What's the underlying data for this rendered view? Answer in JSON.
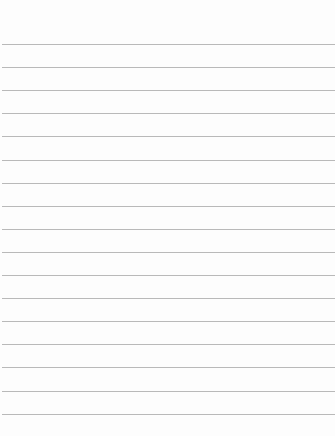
{
  "page": {
    "type": "lined-paper",
    "background_color": "#fdfdfd",
    "rule_color": "#b9b9b9",
    "rule_count": 17,
    "first_rule_y": 44,
    "rule_spacing": 23.1
  }
}
